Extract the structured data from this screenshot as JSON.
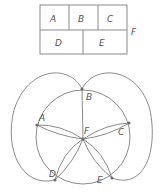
{
  "map_diagram": {
    "regions": [
      {
        "id": "A",
        "label": "A"
      },
      {
        "id": "B",
        "label": "B"
      },
      {
        "id": "C",
        "label": "C"
      },
      {
        "id": "D",
        "label": "D"
      },
      {
        "id": "E",
        "label": "E"
      }
    ],
    "outside_label": "F"
  },
  "dual_graph": {
    "vertices": [
      {
        "id": "A",
        "label": "A"
      },
      {
        "id": "B",
        "label": "B"
      },
      {
        "id": "C",
        "label": "C"
      },
      {
        "id": "D",
        "label": "D"
      },
      {
        "id": "E",
        "label": "E"
      },
      {
        "id": "F",
        "label": "F"
      }
    ],
    "edges": [
      [
        "A",
        "B"
      ],
      [
        "B",
        "C"
      ],
      [
        "C",
        "E"
      ],
      [
        "E",
        "D"
      ],
      [
        "D",
        "A"
      ],
      [
        "F",
        "A"
      ],
      [
        "F",
        "B"
      ],
      [
        "F",
        "C"
      ],
      [
        "F",
        "D"
      ],
      [
        "F",
        "E"
      ],
      [
        "B",
        "D"
      ],
      [
        "B",
        "E"
      ]
    ]
  },
  "colors": {
    "stroke": "#8a8a8a",
    "label": "#555555",
    "background": "#ffffff"
  }
}
